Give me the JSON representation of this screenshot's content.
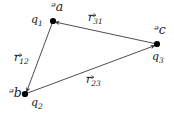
{
  "figure": {
    "background_color": "#ffffff",
    "line_color": "#3a3a3a",
    "dot_color": "#000000",
    "width": 174,
    "height": 114,
    "vertices": [
      {
        "id": "v1",
        "point_label": "ᵊa",
        "point_label_plain": "O",
        "charge_label": "q",
        "charge_sub": "1",
        "x": 53,
        "y": 21
      },
      {
        "id": "v3",
        "point_label": "ᵊc",
        "point_label_plain": "Q",
        "charge_label": "q",
        "charge_sub": "3",
        "x": 157,
        "y": 44
      },
      {
        "id": "v2",
        "point_label": "ᵊb",
        "point_label_plain": "P",
        "charge_label": "q",
        "charge_sub": "2",
        "x": 25,
        "y": 94
      }
    ],
    "vectors": [
      {
        "id": "r12",
        "symbol": "r",
        "sub": "12",
        "from": "v1",
        "to": "v2",
        "label_x": 14,
        "label_y": 52
      },
      {
        "id": "r23",
        "symbol": "r",
        "sub": "23",
        "from": "v2",
        "to": "v3",
        "label_x": 86,
        "label_y": 74
      },
      {
        "id": "r31",
        "symbol": "r",
        "sub": "31",
        "from": "v3",
        "to": "v1",
        "label_x": 88,
        "label_y": 12
      }
    ]
  }
}
